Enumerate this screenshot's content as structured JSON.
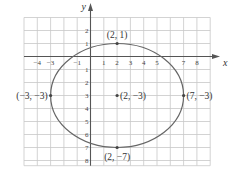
{
  "chart_data": {
    "type": "scatter",
    "title": "",
    "xlabel": "x",
    "ylabel": "y",
    "xlim": [
      -5,
      9
    ],
    "ylim": [
      -8,
      3
    ],
    "grid": true,
    "x_ticks": [
      "-4",
      "-3",
      "-1",
      "1",
      "2",
      "3",
      "4",
      "5",
      "7",
      "8"
    ],
    "y_ticks": [
      "2",
      "1",
      "-1",
      "-2",
      "-3",
      "-4",
      "-5",
      "-6",
      "-7",
      "-8"
    ],
    "curve": {
      "kind": "ellipse",
      "center": [
        2,
        -3
      ],
      "semi_axis_x": 5,
      "semi_axis_y": 4
    },
    "points": [
      {
        "x": 2,
        "y": 1,
        "label": "(2, 1)"
      },
      {
        "x": -3,
        "y": -3,
        "label": "(−3, −3)"
      },
      {
        "x": 2,
        "y": -3,
        "label": "(2, −3)"
      },
      {
        "x": 7,
        "y": -3,
        "label": "(7, −3)"
      },
      {
        "x": 2,
        "y": -7,
        "label": "(2, −7)"
      }
    ]
  },
  "axes": {
    "x_label": "x",
    "y_label": "y"
  },
  "colors": {
    "grid": "#c8c8c8",
    "axis": "#555555",
    "curve": "#666666",
    "point": "#444444"
  }
}
